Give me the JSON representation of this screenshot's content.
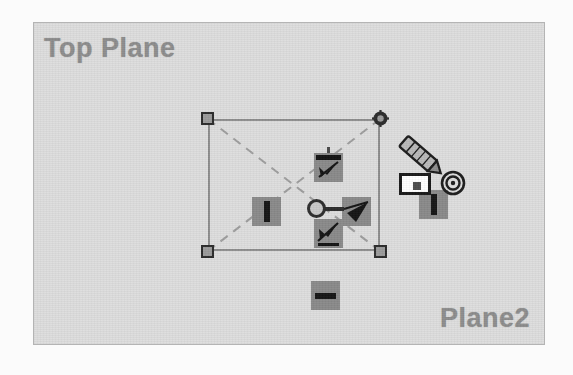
{
  "viewport": {
    "background_color": "#dddddd",
    "border_color": "#b4b4b4"
  },
  "labels": {
    "top_plane": "Top Plane",
    "bottom_plane": "Plane2",
    "color": "#8d8d8d"
  },
  "sketch": {
    "name": "selection-rectangle",
    "edge_color": "#8e8e8e",
    "diagonal_style": "dashed",
    "diagonal_color": "#9d9d9d",
    "handles": [
      {
        "id": "top-left",
        "type": "square"
      },
      {
        "id": "top-right",
        "type": "rotate-node"
      },
      {
        "id": "bottom-left",
        "type": "square"
      },
      {
        "id": "bottom-right",
        "type": "square"
      }
    ]
  },
  "manipulator": {
    "name": "plane-move-manipulator",
    "center_node": "circle-node",
    "arrows": [
      {
        "id": "arrow-up",
        "direction": "up"
      },
      {
        "id": "arrow-right",
        "direction": "right"
      },
      {
        "id": "arrow-down",
        "direction": "down"
      }
    ],
    "chip_color": "#8a8a8a",
    "arrow_color": "#1d1d1d"
  },
  "chips": [
    {
      "id": "chip-left",
      "orientation": "vertical"
    },
    {
      "id": "chip-bottom",
      "orientation": "horizontal"
    },
    {
      "id": "chip-right",
      "orientation": "vertical"
    }
  ],
  "cursor": {
    "name": "pencil-cursor",
    "type": "pencil"
  },
  "callout": {
    "name": "dimension-callout",
    "fill": "#ffffff",
    "border": "#1a1a1a"
  },
  "bullseye": {
    "name": "bullseye-target-icon",
    "rings": 3
  }
}
